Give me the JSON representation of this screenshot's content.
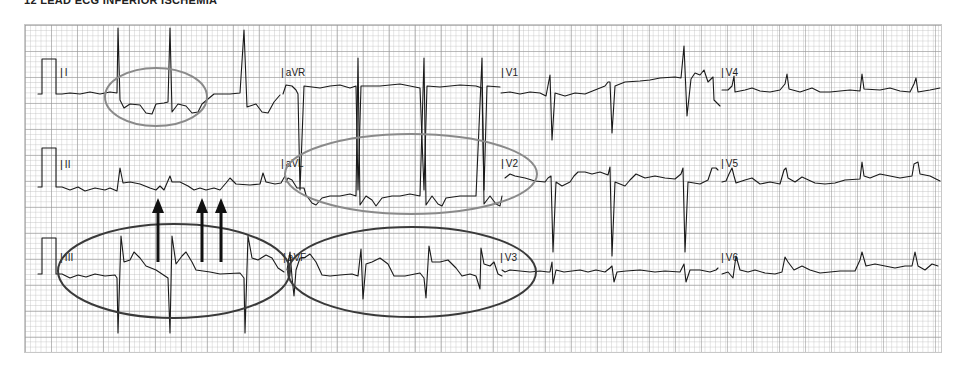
{
  "header": {
    "title": "12 lead ECG inferior ischemia"
  },
  "ecg": {
    "grid": {
      "minor_color": "#bebebe",
      "major_color": "#969696",
      "background": "#ffffff"
    },
    "trace_color": "#1a1a1a",
    "rows": [
      {
        "leads": [
          "I",
          "aVR",
          "V1",
          "V4"
        ]
      },
      {
        "leads": [
          "II",
          "aVL",
          "V2",
          "V5"
        ]
      },
      {
        "leads": [
          "III",
          "aVF",
          "V3",
          "V6"
        ]
      }
    ],
    "labels": {
      "I": "I",
      "aVR": "aVR",
      "V1": "V1",
      "V4": "V4",
      "II": "II",
      "aVL": "aVL",
      "V2": "V2",
      "V5": "V5",
      "III": "III",
      "aVF": "aVF",
      "V3": "V3",
      "V6": "V6"
    },
    "annotations": {
      "ellipses": [
        {
          "id": "lead-I-ellipse",
          "color": "#8a8a8a",
          "around": "Lead I ST depression"
        },
        {
          "id": "lead-aVL-V2-ellipse",
          "color": "#8a8a8a",
          "around": "aVL/V2 ST depression"
        },
        {
          "id": "lead-III-ellipse",
          "color": "#3a3a3a",
          "around": "Lead III ST elevation"
        },
        {
          "id": "lead-aVF-V3-ellipse",
          "color": "#3a3a3a",
          "around": "aVF/V3 ST elevation"
        }
      ],
      "arrows": {
        "count": 3,
        "color": "#111111",
        "direction": "up",
        "pointing_to": "Lead II P waves"
      }
    }
  }
}
